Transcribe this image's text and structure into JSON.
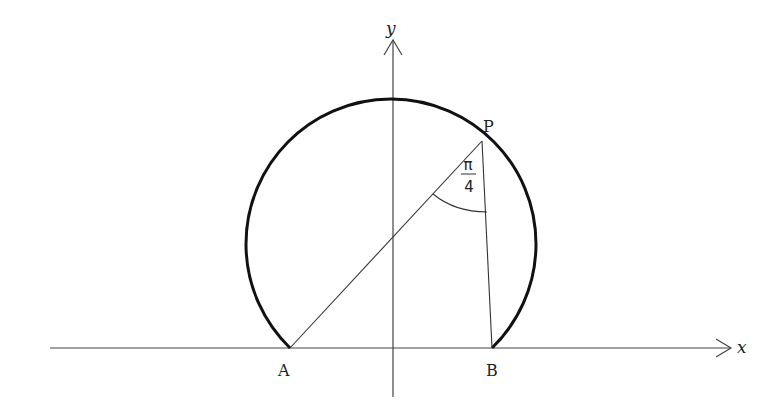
{
  "diagram": {
    "type": "geometry",
    "axes": {
      "x_label": "x",
      "y_label": "y"
    },
    "points": {
      "A": "A",
      "B": "B",
      "P": "P"
    },
    "angle_label": {
      "numerator": "π",
      "denominator": "4"
    },
    "colors": {
      "arc": "#111111",
      "lines": "#333333",
      "axes": "#444444"
    }
  }
}
